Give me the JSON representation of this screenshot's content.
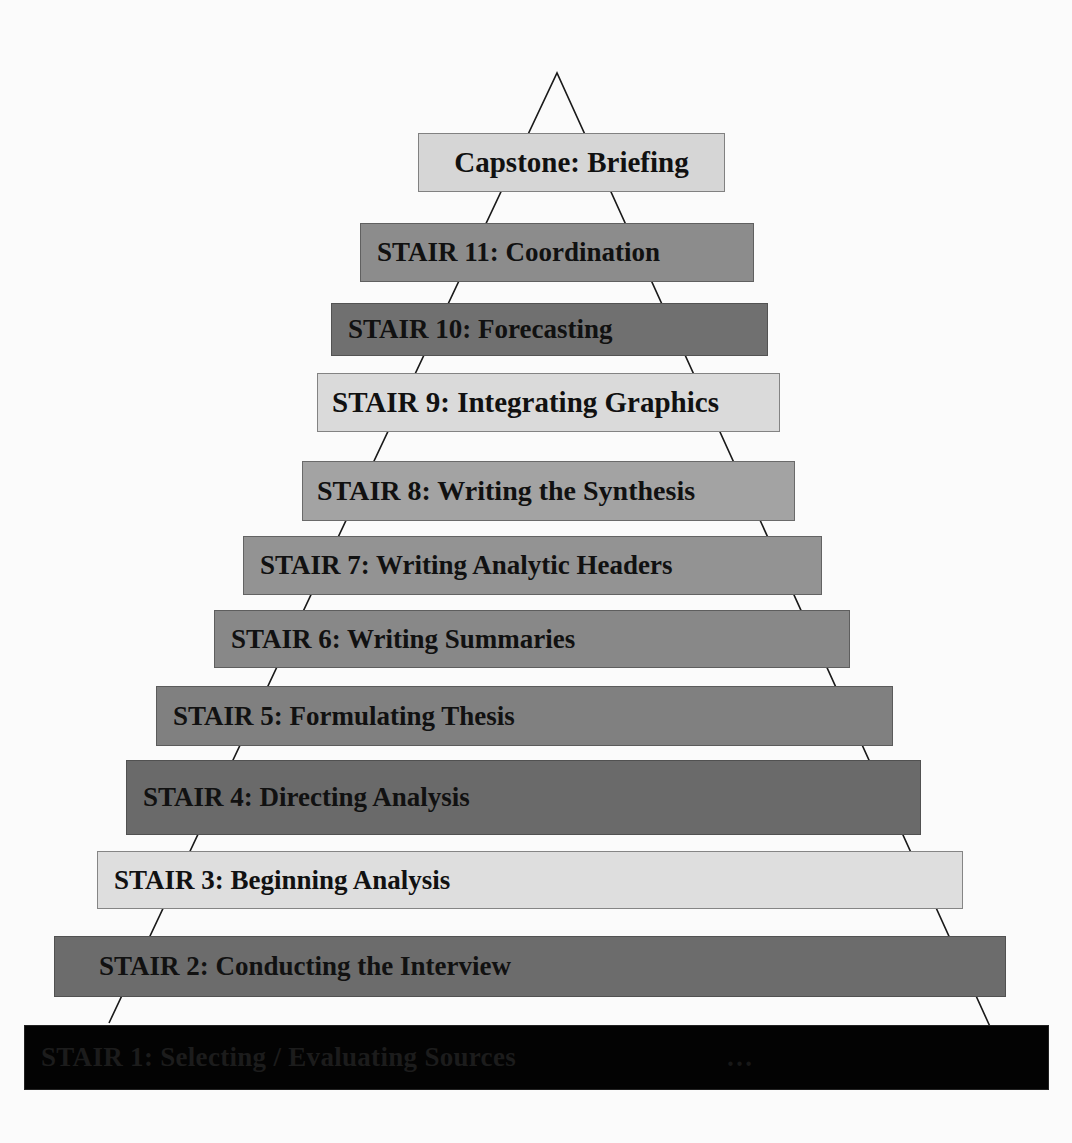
{
  "diagram": {
    "type": "stair-pyramid",
    "apex": {
      "x": 557,
      "y": 73
    },
    "base_left": {
      "x": 109,
      "y": 1023
    },
    "base_right": {
      "x": 992,
      "y": 1031
    },
    "line_color": "#1a1a1a"
  },
  "stairs": [
    {
      "id": "capstone",
      "label": "Capstone: Briefing",
      "color": "#d6d6d6",
      "x": 418,
      "y": 133,
      "w": 307,
      "h": 59,
      "font": 29,
      "align": "center",
      "pad": 0
    },
    {
      "id": "stair-11",
      "label": "STAIR 11: Coordination",
      "color": "#8c8c8c",
      "x": 360,
      "y": 223,
      "w": 394,
      "h": 59,
      "font": 27,
      "align": "left",
      "pad": 16
    },
    {
      "id": "stair-10",
      "label": "STAIR 10: Forecasting",
      "color": "#707070",
      "x": 331,
      "y": 303,
      "w": 437,
      "h": 53,
      "font": 27,
      "align": "left",
      "pad": 16
    },
    {
      "id": "stair-9",
      "label": "STAIR 9: Integrating Graphics",
      "color": "#dadada",
      "x": 317,
      "y": 373,
      "w": 463,
      "h": 59,
      "font": 29,
      "align": "left",
      "pad": 14
    },
    {
      "id": "stair-8",
      "label": "STAIR 8: Writing the Synthesis",
      "color": "#a3a3a3",
      "x": 302,
      "y": 461,
      "w": 493,
      "h": 60,
      "font": 28,
      "align": "left",
      "pad": 14
    },
    {
      "id": "stair-7",
      "label": "STAIR 7: Writing Analytic Headers",
      "color": "#939393",
      "x": 243,
      "y": 536,
      "w": 579,
      "h": 59,
      "font": 27,
      "align": "left",
      "pad": 16
    },
    {
      "id": "stair-6",
      "label": "STAIR 6: Writing Summaries",
      "color": "#888888",
      "x": 214,
      "y": 610,
      "w": 636,
      "h": 58,
      "font": 27,
      "align": "left",
      "pad": 16
    },
    {
      "id": "stair-5",
      "label": "STAIR 5: Formulating Thesis",
      "color": "#808080",
      "x": 156,
      "y": 686,
      "w": 737,
      "h": 60,
      "font": 27,
      "align": "left",
      "pad": 16
    },
    {
      "id": "stair-4",
      "label": "STAIR 4: Directing Analysis",
      "color": "#6a6a6a",
      "x": 126,
      "y": 760,
      "w": 795,
      "h": 75,
      "font": 27,
      "align": "left",
      "pad": 16
    },
    {
      "id": "stair-3",
      "label": "STAIR 3: Beginning Analysis",
      "color": "#dedede",
      "x": 97,
      "y": 851,
      "w": 866,
      "h": 58,
      "font": 27,
      "align": "left",
      "pad": 16
    },
    {
      "id": "stair-2",
      "label": "STAIR 2: Conducting the Interview",
      "color": "#6c6c6c",
      "x": 54,
      "y": 936,
      "w": 952,
      "h": 61,
      "font": 27,
      "align": "left",
      "pad": 44
    },
    {
      "id": "stair-1",
      "label": "STAIR 1: Selecting / Evaluating Sources",
      "label_right": "…",
      "color": "#030303",
      "x": 24,
      "y": 1025,
      "w": 1025,
      "h": 65,
      "font": 27,
      "align": "left",
      "pad": 16
    }
  ]
}
